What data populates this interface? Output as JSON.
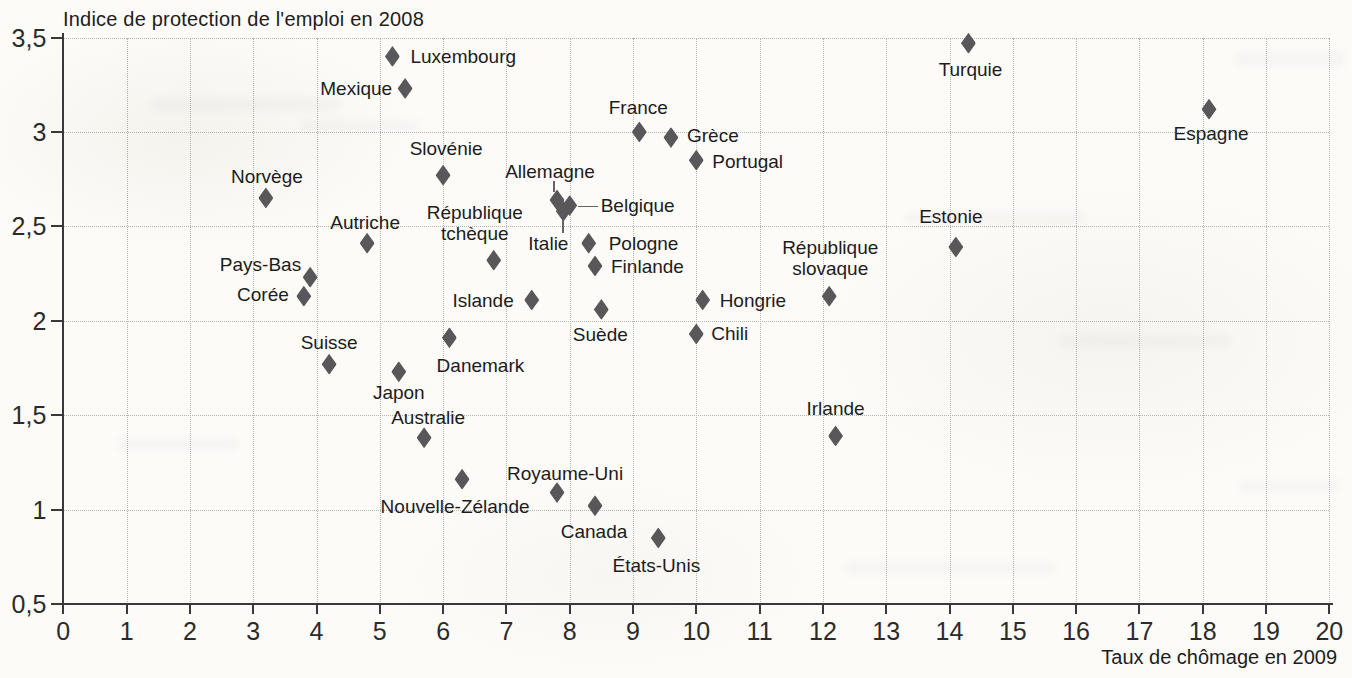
{
  "chart_data": {
    "type": "scatter",
    "title": "",
    "ylabel": "Indice de protection de l'emploi en 2008",
    "xlabel": "Taux de chômage en 2009",
    "xlim": [
      0,
      20
    ],
    "ylim": [
      0.5,
      3.5
    ],
    "grid": true,
    "x_ticks": [
      0,
      1,
      2,
      3,
      4,
      5,
      6,
      7,
      8,
      9,
      10,
      11,
      12,
      13,
      14,
      15,
      16,
      17,
      18,
      19,
      20
    ],
    "x_tick_labels": [
      "0",
      "1",
      "2",
      "3",
      "4",
      "5",
      "6",
      "7",
      "8",
      "9",
      "10",
      "11",
      "12",
      "13",
      "14",
      "15",
      "16",
      "17",
      "18",
      "19",
      "20"
    ],
    "y_ticks": [
      0.5,
      1,
      1.5,
      2,
      2.5,
      3,
      3.5
    ],
    "y_tick_labels": [
      "0,5",
      "1",
      "1,5",
      "2",
      "2,5",
      "3",
      "3,5"
    ],
    "x_gridlines": [
      1,
      2,
      3,
      4,
      5,
      6,
      7,
      8,
      9,
      10,
      11,
      12,
      13,
      14,
      15,
      16,
      17,
      18,
      19,
      20
    ],
    "y_gridlines": [
      1,
      1.5,
      2,
      2.5,
      3,
      3.5
    ],
    "marker_color": "#58585a",
    "grid_color": "#b4b4b4",
    "axis_color": "#39393b",
    "points": [
      {
        "label": "Luxembourg",
        "x": 5.2,
        "y": 3.4,
        "anchor": "left",
        "dx": 18,
        "dy": 0
      },
      {
        "label": "Mexique",
        "x": 5.4,
        "y": 3.23,
        "anchor": "right",
        "dx": -13,
        "dy": 0
      },
      {
        "label": "Turquie",
        "x": 14.3,
        "y": 3.47,
        "anchor": "center",
        "dx": 2,
        "dy": 26
      },
      {
        "label": "Espagne",
        "x": 18.1,
        "y": 3.12,
        "anchor": "center",
        "dx": 2,
        "dy": 24
      },
      {
        "label": "France",
        "x": 9.1,
        "y": 3.0,
        "anchor": "center",
        "dx": -1,
        "dy": -25
      },
      {
        "label": "Grèce",
        "x": 9.6,
        "y": 2.97,
        "anchor": "left",
        "dx": 16,
        "dy": -3
      },
      {
        "label": "Portugal",
        "x": 10.0,
        "y": 2.85,
        "anchor": "left",
        "dx": 16,
        "dy": 1
      },
      {
        "label": "Slovénie",
        "x": 6.0,
        "y": 2.77,
        "anchor": "center",
        "dx": 3,
        "dy": -27
      },
      {
        "label": "Norvège",
        "x": 3.2,
        "y": 2.65,
        "anchor": "center",
        "dx": 1,
        "dy": -22
      },
      {
        "label": "Allemagne",
        "x": 7.8,
        "y": 2.64,
        "anchor": "center",
        "dx": -7,
        "dy": -29,
        "leader": {
          "dir": "v",
          "at": -4,
          "from": -19,
          "to": -8
        }
      },
      {
        "label": "Belgique",
        "x": 8.0,
        "y": 2.61,
        "anchor": "left",
        "dx": 31,
        "dy": -1,
        "leader": {
          "dir": "h",
          "at": 0,
          "from": 8,
          "to": 28
        }
      },
      {
        "label": "Italie",
        "x": 7.9,
        "y": 2.58,
        "anchor": "center",
        "dx": -15,
        "dy": 32,
        "leader": {
          "dir": "v",
          "at": -1,
          "from": 8,
          "to": 22
        }
      },
      {
        "label": "Autriche",
        "x": 4.8,
        "y": 2.41,
        "anchor": "center",
        "dx": -2,
        "dy": -21
      },
      {
        "label": "Pologne",
        "x": 8.3,
        "y": 2.41,
        "anchor": "left",
        "dx": 20,
        "dy": 0
      },
      {
        "label": "République\ntchèque",
        "x": 6.8,
        "y": 2.32,
        "anchor": "center",
        "dx": -19,
        "dy": -37
      },
      {
        "label": "Estonie",
        "x": 14.1,
        "y": 2.39,
        "anchor": "center",
        "dx": -5,
        "dy": -31
      },
      {
        "label": "Pays-Bas",
        "x": 3.9,
        "y": 2.23,
        "anchor": "right",
        "dx": -9,
        "dy": -13
      },
      {
        "label": "Finlande",
        "x": 8.4,
        "y": 2.29,
        "anchor": "left",
        "dx": 16,
        "dy": 0
      },
      {
        "label": "Corée",
        "x": 3.8,
        "y": 2.13,
        "anchor": "right",
        "dx": -15,
        "dy": -2
      },
      {
        "label": "Islande",
        "x": 7.4,
        "y": 2.11,
        "anchor": "right",
        "dx": -18,
        "dy": 0
      },
      {
        "label": "Hongrie",
        "x": 10.1,
        "y": 2.11,
        "anchor": "left",
        "dx": 17,
        "dy": 0
      },
      {
        "label": "République\nslovaque",
        "x": 12.1,
        "y": 2.13,
        "anchor": "center",
        "dx": 1,
        "dy": -38
      },
      {
        "label": "Suède",
        "x": 8.5,
        "y": 2.06,
        "anchor": "center",
        "dx": -1,
        "dy": 25
      },
      {
        "label": "Chili",
        "x": 10.0,
        "y": 1.93,
        "anchor": "left",
        "dx": 15,
        "dy": -1
      },
      {
        "label": "Danemark",
        "x": 6.1,
        "y": 1.91,
        "anchor": "center",
        "dx": 31,
        "dy": 27
      },
      {
        "label": "Suisse",
        "x": 4.2,
        "y": 1.77,
        "anchor": "center",
        "dx": 0,
        "dy": -22
      },
      {
        "label": "Japon",
        "x": 5.3,
        "y": 1.73,
        "anchor": "center",
        "dx": 0,
        "dy": 20
      },
      {
        "label": "Australie",
        "x": 5.7,
        "y": 1.38,
        "anchor": "center",
        "dx": 4,
        "dy": -21
      },
      {
        "label": "Irlande",
        "x": 12.2,
        "y": 1.39,
        "anchor": "center",
        "dx": 0,
        "dy": -28
      },
      {
        "label": "Nouvelle-Zélande",
        "x": 6.3,
        "y": 1.16,
        "anchor": "center",
        "dx": -7,
        "dy": 27
      },
      {
        "label": "Royaume-Uni",
        "x": 7.8,
        "y": 1.09,
        "anchor": "center",
        "dx": 8,
        "dy": -20
      },
      {
        "label": "Canada",
        "x": 8.4,
        "y": 1.02,
        "anchor": "center",
        "dx": -1,
        "dy": 25
      },
      {
        "label": "États-Unis",
        "x": 9.4,
        "y": 0.85,
        "anchor": "center",
        "dx": -2,
        "dy": 27
      }
    ]
  }
}
